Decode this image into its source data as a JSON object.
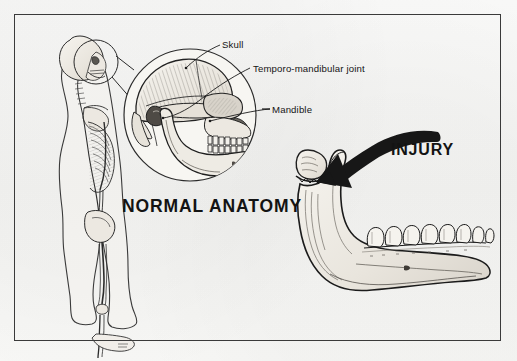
{
  "plate": {
    "background_color": "#f6f6f4",
    "border_color": "#3a3a3a",
    "ink_color": "#1a1a1a",
    "bone_fill": "#efece6",
    "shade_fill": "#cfcac2"
  },
  "captions": {
    "normal_anatomy": "NORMAL ANATOMY",
    "injury": "INJURY"
  },
  "callouts": [
    {
      "id": "skull",
      "label": "Skull"
    },
    {
      "id": "tmj",
      "label": "Temporo-mandibular joint"
    },
    {
      "id": "mandible",
      "label": "Mandible"
    }
  ],
  "panels": {
    "left": {
      "name": "normal-anatomy-panel",
      "skeleton_figure": "lateral full-body skeleton with body outline",
      "magnifier": {
        "source_circle": "small circle around skeleton head",
        "detail_circle": "enlarged lateral view of skull and mandible"
      }
    },
    "right": {
      "name": "injury-panel",
      "subject": "isolated mandible, lateral view",
      "finding": "fractured and displaced mandibular condyle",
      "arrow": "curved black arrow pointing to fracture site"
    }
  }
}
